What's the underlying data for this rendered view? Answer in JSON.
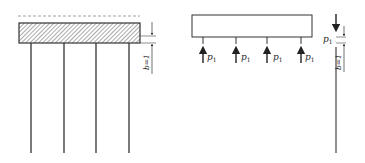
{
  "diagram": {
    "left": {
      "description": "hatched slab supported by four vertical rods",
      "dimension_label": "b=1",
      "rod_count": 4
    },
    "right": {
      "description": "free body of slab with four upward loads, and single rod with downward load",
      "load_labels": [
        {
          "symbol": "p",
          "subscript": "1"
        },
        {
          "symbol": "p",
          "subscript": "1"
        },
        {
          "symbol": "p",
          "subscript": "1"
        },
        {
          "symbol": "p",
          "subscript": "1"
        }
      ],
      "rod_load_label": {
        "symbol": "p",
        "subscript": "1"
      },
      "dimension_label": "b=1"
    },
    "colors": {
      "line": "#333333",
      "hatch": "#555555",
      "dashed": "#888888"
    }
  }
}
